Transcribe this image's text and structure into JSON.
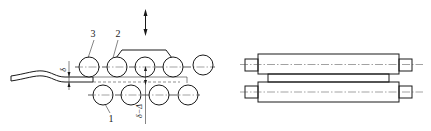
{
  "figure": {
    "side_view": {
      "labels": {
        "roll_1": "1",
        "roll_2": "2",
        "roll_3": "3"
      },
      "dimensions": {
        "left_gap": "δ",
        "bottom_gap": "δ−Δ"
      },
      "adjust_arrow": "up-down-arrow",
      "top_rolls_count": 5,
      "bottom_rolls_count": 4
    },
    "end_view": {
      "rolls": 2,
      "strip": "hatched-strip"
    },
    "colors": {
      "line": "#1a1a1a",
      "background": "#ffffff"
    }
  }
}
